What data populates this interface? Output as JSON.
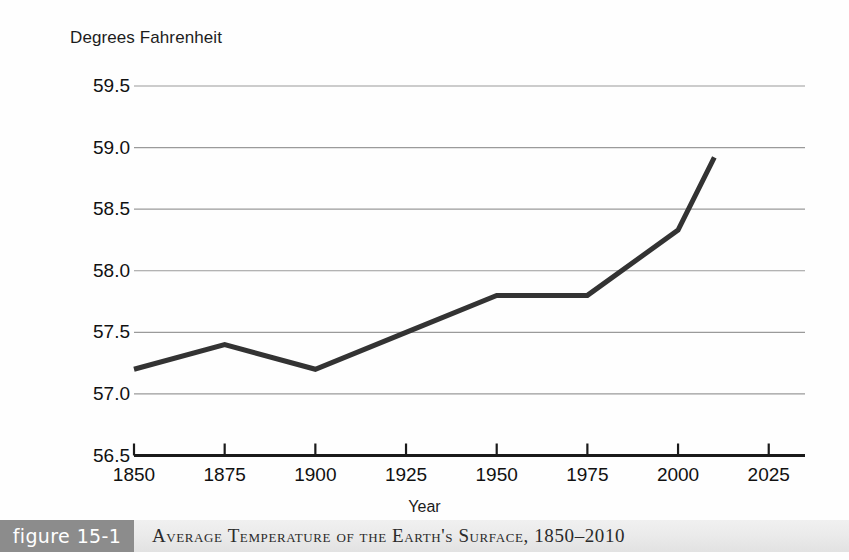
{
  "figure": {
    "number_label": "figure 15-1",
    "caption": "Average Temperature of the Earth's Surface, 1850–2010",
    "number_box_color": "#8c8c8c",
    "caption_bar_color": "#ebebeb"
  },
  "chart_data": {
    "type": "line",
    "title": "Average Temperature of the Earth's Surface, 1850–2010",
    "xlabel": "Year",
    "ylabel": "Degrees Fahrenheit",
    "x": [
      1850,
      1875,
      1900,
      1925,
      1950,
      1975,
      2000,
      2010
    ],
    "values": [
      57.2,
      57.4,
      57.2,
      57.5,
      57.8,
      57.8,
      58.33,
      58.92
    ],
    "series": [
      {
        "name": "Average surface temperature",
        "values": [
          57.2,
          57.4,
          57.2,
          57.5,
          57.8,
          57.8,
          58.33,
          58.92
        ]
      }
    ],
    "xlim": [
      1850,
      2035
    ],
    "ylim": [
      56.5,
      59.5
    ],
    "xticks": [
      1850,
      1875,
      1900,
      1925,
      1950,
      1975,
      2000,
      2025
    ],
    "xtick_labels": [
      "1850",
      "1875",
      "1900",
      "1925",
      "1950",
      "1975",
      "2000",
      "2025"
    ],
    "yticks": [
      56.5,
      57.0,
      57.5,
      58.0,
      58.5,
      59.0,
      59.5
    ],
    "ytick_labels": [
      "56.5",
      "57.0",
      "57.5",
      "58.0",
      "58.5",
      "59.0",
      "59.5"
    ],
    "grid": true,
    "grid_axis": "y",
    "grid_color": "#9a9a9a",
    "line_color": "#333333",
    "line_width": 5,
    "legend": false,
    "legend_position": "none"
  }
}
